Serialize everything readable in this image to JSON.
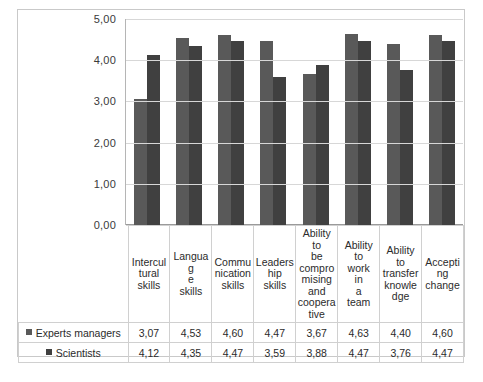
{
  "chart_data": {
    "type": "bar",
    "title": "",
    "subtitle": "",
    "xlabel": "",
    "ylabel": "",
    "ylim": [
      0,
      5
    ],
    "ytick_step": 1,
    "ytick_labels": [
      "5,00",
      "4,00",
      "3,00",
      "2,00",
      "1,00",
      "0,00"
    ],
    "grid": true,
    "legend_position": "left-column-of-data-table",
    "decimal_separator": ",",
    "categories": [
      "Intercultural skills",
      "Language skills",
      "Communication skills",
      "Leadership skills",
      "Ability to be compromising and cooperative",
      "Ability to work in a team",
      "Ability to transfer knowledge",
      "Accepting change"
    ],
    "category_labels_wrapped": [
      "Intercul tural skills",
      "Languag e skills",
      "Commu nication skills",
      "Leaders hip skills",
      "Ability to be compro mising and coopera tive",
      "Ability to work in a team",
      "Ability to transfer knowle dge",
      "Accepti ng change"
    ],
    "series": [
      {
        "name": "Experts managers",
        "color": "#595959",
        "values": [
          3.07,
          4.53,
          4.6,
          4.47,
          3.67,
          4.63,
          4.4,
          4.6
        ],
        "value_labels": [
          "3,07",
          "4,53",
          "4,60",
          "4,47",
          "3,67",
          "4,63",
          "4,40",
          "4,60"
        ]
      },
      {
        "name": "Scientists",
        "color": "#404040",
        "values": [
          4.12,
          4.35,
          4.47,
          3.59,
          3.88,
          4.47,
          3.76,
          4.47
        ],
        "value_labels": [
          "4,12",
          "4,35",
          "4,47",
          "3,59",
          "3,88",
          "4,47",
          "3,76",
          "4,47"
        ]
      }
    ]
  },
  "colors": {
    "series_1": "#595959",
    "series_2": "#404040",
    "gridline": "#d7d7d7",
    "frame_border": "#c9c9c9",
    "table_border": "#d0d0d0"
  }
}
